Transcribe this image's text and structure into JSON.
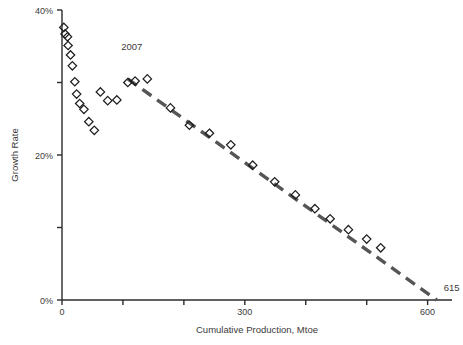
{
  "chart_data": {
    "type": "scatter",
    "title": "",
    "xlabel": "Cumulative Production, Mtoe",
    "ylabel": "Growth Rate",
    "xlim": [
      0,
      640
    ],
    "ylim": [
      0,
      40
    ],
    "grid": false,
    "legend_position": "none",
    "x_ticks": [
      0,
      100,
      200,
      300,
      400,
      500,
      600
    ],
    "x_tick_labels": [
      "0",
      "",
      "",
      "300",
      "",
      "",
      "600"
    ],
    "y_ticks": [
      0,
      10,
      20,
      30,
      40
    ],
    "y_tick_labels": [
      "0%",
      "",
      "20%",
      "",
      "40%"
    ],
    "series": [
      {
        "name": "Observed",
        "marker": "diamond-open",
        "x": [
          3,
          5,
          9,
          10,
          14,
          17,
          21,
          24,
          29,
          36,
          44,
          53,
          63,
          75,
          90,
          108,
          120,
          140,
          178,
          209,
          242,
          277,
          313,
          349,
          383,
          415,
          440,
          470,
          500,
          523
        ],
        "y": [
          37.6,
          36.7,
          36.3,
          35.1,
          33.8,
          32.3,
          30.1,
          28.4,
          27.1,
          26.3,
          24.6,
          23.4,
          28.7,
          27.5,
          27.6,
          30.0,
          30.2,
          30.5,
          26.5,
          24.1,
          23.0,
          21.4,
          18.6,
          16.3,
          14.5,
          12.6,
          11.2,
          9.7,
          8.4,
          7.2
        ]
      }
    ],
    "trend_line": {
      "style": "dashed",
      "color": "#555555",
      "x_start": 108,
      "y_start": 30.5,
      "x_end": 615,
      "y_end": 0
    },
    "annotations": [
      {
        "name": "peak-year-label",
        "text": "2007",
        "x": 108,
        "y": 34.5
      },
      {
        "name": "x-intercept-label",
        "text": "615",
        "x": 623,
        "y": 1.6
      }
    ]
  },
  "caption": {
    "text": ""
  }
}
